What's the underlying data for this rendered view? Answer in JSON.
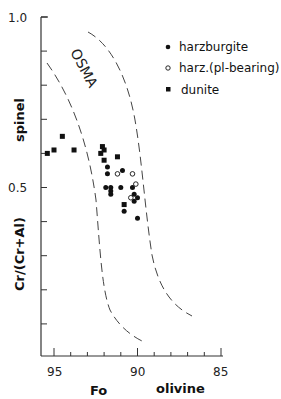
{
  "chart_data": {
    "type": "scatter",
    "title": "",
    "xlabel": "Fo olivine",
    "xlabel_parts": [
      "Fo",
      "olivine"
    ],
    "ylabel": "Cr/(Cr+Al) spinel",
    "ylabel_parts": [
      "Cr/(Cr+Al)",
      "spinel"
    ],
    "xlim": [
      95.8,
      84.8
    ],
    "ylim": [
      0.0,
      1.0
    ],
    "x_reversed": true,
    "x_ticks": [
      95,
      90,
      85
    ],
    "x_tick_labels": [
      "95",
      "90",
      "85"
    ],
    "x_minor_step": 1,
    "y_ticks": [
      0.5,
      1.0
    ],
    "y_tick_labels": [
      "0.5",
      "1.0"
    ],
    "y_minor_step": 0.1,
    "grid": false,
    "legend_position": "upper right",
    "annotations": [
      {
        "text": "OSMA",
        "x": 93.2,
        "y": 0.82,
        "rotation": 60
      }
    ],
    "boundaries": [
      {
        "name": "OSMA-left",
        "style": "dashed",
        "points": [
          [
            95.4,
            0.86
          ],
          [
            94.3,
            0.72
          ],
          [
            93.2,
            0.55
          ],
          [
            92.7,
            0.35
          ],
          [
            92.1,
            0.18
          ],
          [
            90.8,
            0.07
          ]
        ]
      },
      {
        "name": "OSMA-right",
        "style": "dashed",
        "points": [
          [
            92.9,
            0.95
          ],
          [
            91.3,
            0.85
          ],
          [
            90.3,
            0.72
          ],
          [
            89.8,
            0.56
          ],
          [
            89.2,
            0.3
          ],
          [
            88.3,
            0.16
          ],
          [
            87.5,
            0.12
          ]
        ]
      }
    ],
    "series": [
      {
        "name": "harzburgite",
        "marker": "filled-circle",
        "points": [
          {
            "x": 91.8,
            "y": 0.56
          },
          {
            "x": 91.8,
            "y": 0.54
          },
          {
            "x": 90.9,
            "y": 0.55
          },
          {
            "x": 91.9,
            "y": 0.5
          },
          {
            "x": 91.6,
            "y": 0.5
          },
          {
            "x": 91.6,
            "y": 0.49
          },
          {
            "x": 91.6,
            "y": 0.48
          },
          {
            "x": 91.0,
            "y": 0.5
          },
          {
            "x": 90.3,
            "y": 0.5
          },
          {
            "x": 90.2,
            "y": 0.48
          },
          {
            "x": 90.0,
            "y": 0.47
          },
          {
            "x": 90.2,
            "y": 0.46
          },
          {
            "x": 90.8,
            "y": 0.43
          },
          {
            "x": 90.0,
            "y": 0.41
          }
        ]
      },
      {
        "name": "harz.(pl-bearing)",
        "marker": "open-circle",
        "points": [
          {
            "x": 91.2,
            "y": 0.54
          },
          {
            "x": 90.3,
            "y": 0.54
          },
          {
            "x": 90.1,
            "y": 0.51
          },
          {
            "x": 90.4,
            "y": 0.47
          }
        ]
      },
      {
        "name": "dunite",
        "marker": "filled-square",
        "points": [
          {
            "x": 95.4,
            "y": 0.6
          },
          {
            "x": 95.0,
            "y": 0.61
          },
          {
            "x": 94.5,
            "y": 0.65
          },
          {
            "x": 93.8,
            "y": 0.61
          },
          {
            "x": 92.1,
            "y": 0.62
          },
          {
            "x": 92.0,
            "y": 0.61
          },
          {
            "x": 92.2,
            "y": 0.6
          },
          {
            "x": 92.0,
            "y": 0.58
          },
          {
            "x": 91.2,
            "y": 0.59
          },
          {
            "x": 90.8,
            "y": 0.45
          }
        ]
      }
    ]
  },
  "legend": {
    "items": [
      {
        "label": "harzburgite",
        "marker": "filled-circle"
      },
      {
        "label": "harz.(pl-bearing)",
        "marker": "open-circle"
      },
      {
        "label": "dunite",
        "marker": "filled-square"
      }
    ]
  },
  "axes": {
    "x_tick_95": "95",
    "x_tick_90": "90",
    "x_tick_85": "85",
    "y_tick_05": "0.5",
    "y_tick_10": "1.0",
    "x_label_left": "Fo",
    "x_label_right": "olivine",
    "y_label_bottom": "Cr/(Cr+Al)",
    "y_label_top": "spinel",
    "field_label": "OSMA"
  },
  "colors": {
    "ink": "#111111",
    "axis": "#333333",
    "dash": "#444444",
    "background": "#ffffff"
  }
}
